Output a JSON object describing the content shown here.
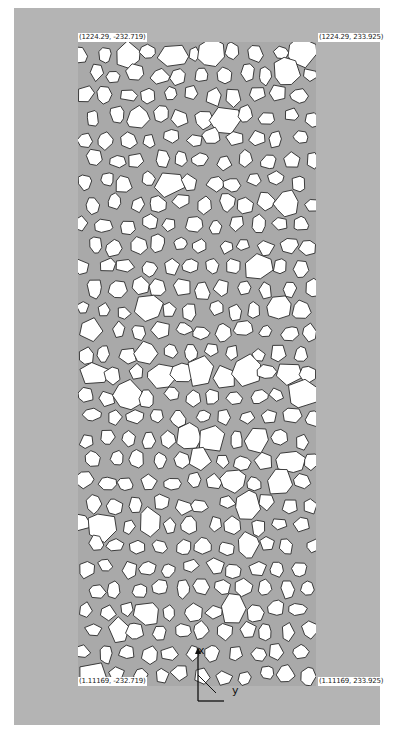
{
  "figure": {
    "colors": {
      "background_panel": "#b4b4b4",
      "mortar": "#a9a9a9",
      "aggregate_fill": "#ffffff",
      "aggregate_edge": "#2a2a2a"
    },
    "aggregates": {
      "seed": 7,
      "cols": 11,
      "rows": 30
    }
  },
  "corner_labels": {
    "top_left": "(1224.29, -232.719)",
    "top_right": "(1224.29, 233.925)",
    "bottom_left": "(1.11169, -232.719)",
    "bottom_right": "(1.11169, 233.925)"
  },
  "axes": {
    "x_label": "x",
    "y_label": "y"
  }
}
